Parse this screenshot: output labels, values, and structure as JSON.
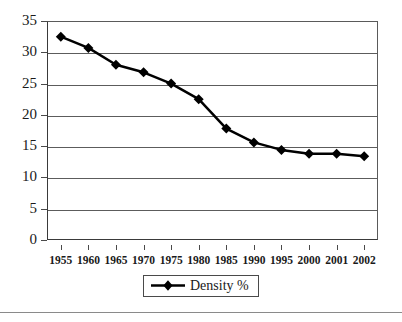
{
  "chart_data": {
    "type": "line",
    "title": "",
    "subtitle": "",
    "xlabel": "",
    "ylabel": "",
    "categories": [
      "1955",
      "1960",
      "1965",
      "1970",
      "1975",
      "1980",
      "1985",
      "1990",
      "1995",
      "2000",
      "2001",
      "2002"
    ],
    "series": [
      {
        "name": "Density %",
        "marker": "diamond",
        "color": "#000000",
        "values": [
          32.5,
          30.7,
          28.0,
          26.8,
          25.0,
          22.5,
          17.8,
          15.6,
          14.4,
          13.8,
          13.8,
          13.4
        ]
      }
    ],
    "ylim": [
      0,
      35
    ],
    "ytick_labels": [
      "0",
      "5",
      "10",
      "15",
      "20",
      "25",
      "30",
      "35"
    ],
    "ytick_values": [
      0,
      5,
      10,
      15,
      20,
      25,
      30,
      35
    ],
    "grid": "horizontal",
    "legend_position": "bottom-center",
    "legend_entries": [
      "Density %"
    ]
  },
  "legend": {
    "label": "Density %",
    "marker_icon": "diamond-marker-icon",
    "line_icon": "legend-line-icon"
  },
  "colors": {
    "series": "#000000",
    "grid": "#5c5c5c",
    "axis": "#3a3a3a",
    "text": "#1a1a1a",
    "background": "#ffffff",
    "rule": "#8a8a8a"
  }
}
